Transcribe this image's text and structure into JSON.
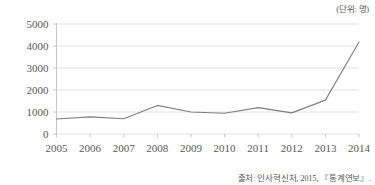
{
  "unit_label": "(단위: 명)",
  "source_note": "출처: 인사혁신처, 2015, 『통계연보』.",
  "chart_data": {
    "type": "line",
    "title": "",
    "subtitle": "",
    "xlabel": "",
    "ylabel": "",
    "unit": "명",
    "categories": [
      "2005",
      "2006",
      "2007",
      "2008",
      "2009",
      "2010",
      "2011",
      "2012",
      "2013",
      "2014"
    ],
    "values": [
      680,
      780,
      690,
      1300,
      1000,
      940,
      1200,
      960,
      1540,
      4180
    ],
    "series": [
      {
        "name": "",
        "values": [
          680,
          780,
          690,
          1300,
          1000,
          940,
          1200,
          960,
          1540,
          4180
        ]
      }
    ],
    "ylim": [
      0,
      5000
    ],
    "y_ticks": [
      "0",
      "1000",
      "2000",
      "3000",
      "4000",
      "5000"
    ],
    "y_tick_values": [
      0,
      1000,
      2000,
      3000,
      4000,
      5000
    ],
    "grid": true,
    "legend": false,
    "legend_position": "none",
    "line_color": "#7f7f7f",
    "grid_color": "#d9d9d9",
    "axis_color": "#bfbfbf",
    "markers": false
  }
}
